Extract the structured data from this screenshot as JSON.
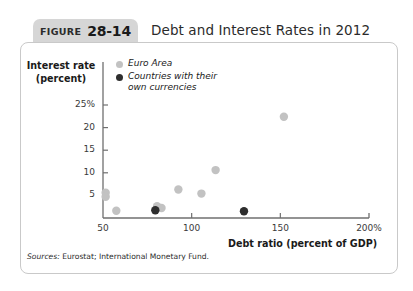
{
  "figure": {
    "tab_word": "FIGURE",
    "tab_number": "28-14",
    "title": "Debt and Interest Rates in 2012",
    "source_lead": "Sources:",
    "source_text": "Eurostat; International Monetary Fund."
  },
  "legend": {
    "items": [
      {
        "label": "Euro Area",
        "color": "#c2c2c2",
        "marker": "legend-dot-euro-area"
      },
      {
        "label": "Countries with their\nown currencies",
        "color": "#2e2e2e",
        "marker": "legend-dot-own-currencies"
      }
    ]
  },
  "axes": {
    "y_title": "Interest rate\n(percent)",
    "x_title": "Debt ratio (percent of GDP)",
    "y_ticks": [
      "25%",
      "20",
      "15",
      "10",
      "5"
    ],
    "x_ticks": [
      "50",
      "100",
      "150",
      "200%"
    ]
  },
  "chart_data": {
    "type": "scatter",
    "title": "Debt and Interest Rates in 2012",
    "xlabel": "Debt ratio (percent of GDP)",
    "ylabel": "Interest rate (percent)",
    "xlim": [
      50,
      200
    ],
    "ylim": [
      0,
      27
    ],
    "xticks": [
      50,
      100,
      150,
      200
    ],
    "yticks": [
      5,
      10,
      15,
      20,
      25
    ],
    "grid": false,
    "legend_position": "top-left-inside",
    "series": [
      {
        "name": "Euro Area",
        "color": "#c2c2c2",
        "points": [
          {
            "x": 51.5,
            "y": 5.6
          },
          {
            "x": 51.5,
            "y": 4.7
          },
          {
            "x": 57.5,
            "y": 1.6
          },
          {
            "x": 80.5,
            "y": 2.6
          },
          {
            "x": 83.0,
            "y": 2.2
          },
          {
            "x": 92.5,
            "y": 6.3
          },
          {
            "x": 105.5,
            "y": 5.4
          },
          {
            "x": 113.5,
            "y": 10.6
          },
          {
            "x": 152.0,
            "y": 22.4
          }
        ]
      },
      {
        "name": "Countries with their own currencies",
        "color": "#2e2e2e",
        "points": [
          {
            "x": 79.5,
            "y": 1.7
          },
          {
            "x": 129.5,
            "y": 1.5
          }
        ]
      }
    ]
  }
}
